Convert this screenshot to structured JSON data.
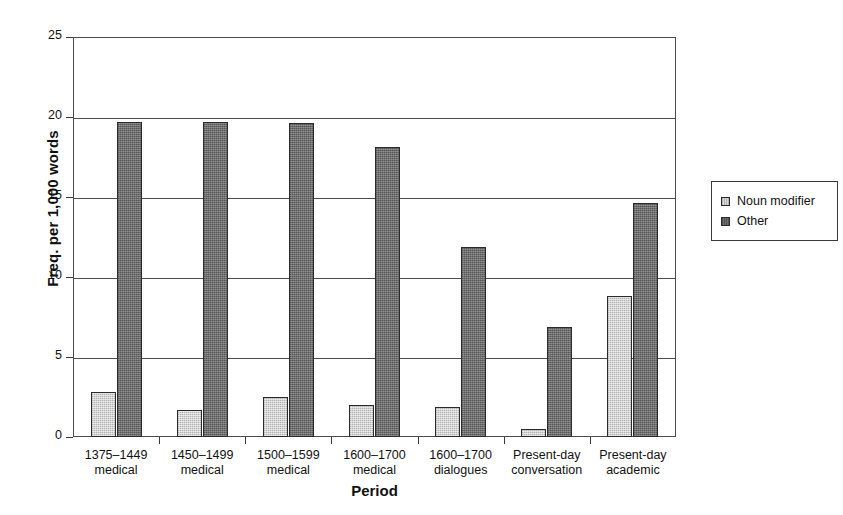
{
  "figure": {
    "top_caption": "",
    "plot": {
      "left": 73,
      "top": 37,
      "width": 603,
      "height": 400
    }
  },
  "chart_data": {
    "type": "bar",
    "title": "",
    "xlabel": "Period",
    "ylabel": "Freq. per 1,000 words",
    "ylim": [
      0,
      25
    ],
    "yticks": [
      0,
      5,
      10,
      15,
      20,
      25
    ],
    "ytick_labels": [
      "0",
      "5",
      "10",
      "15",
      "20",
      "25"
    ],
    "grid": true,
    "grid_axis": "y",
    "legend_position": "right-outside",
    "categories": [
      "1375–1449 medical",
      "1450–1499 medical",
      "1500–1599 medical",
      "1600–1700 medical",
      "1600–1700 dialogues",
      "Present-day conversation",
      "Present-day academic"
    ],
    "category_lines": [
      [
        "1375–1449",
        "medical"
      ],
      [
        "1450–1499",
        "medical"
      ],
      [
        "1500–1599",
        "medical"
      ],
      [
        "1600–1700",
        "medical"
      ],
      [
        "1600–1700",
        "dialogues"
      ],
      [
        "Present-day",
        "conversation"
      ],
      [
        "Present-day",
        "academic"
      ]
    ],
    "series": [
      {
        "name": "Noun modifier",
        "color": "#d3d3d3",
        "values": [
          2.8,
          1.7,
          2.5,
          2.0,
          1.9,
          0.5,
          8.8
        ]
      },
      {
        "name": "Other",
        "color": "#6e6e6e",
        "values": [
          19.7,
          19.7,
          19.6,
          18.1,
          11.9,
          6.9,
          14.6
        ]
      }
    ]
  },
  "legend": {
    "items": [
      {
        "label": "Noun modifier",
        "swatch": "noun"
      },
      {
        "label": "Other",
        "swatch": "other"
      }
    ]
  },
  "colors": {
    "noun_modifier": "#d3d3d3",
    "other": "#6e6e6e",
    "axis": "#4c4c4c",
    "text": "#111111",
    "background": "#ffffff"
  }
}
